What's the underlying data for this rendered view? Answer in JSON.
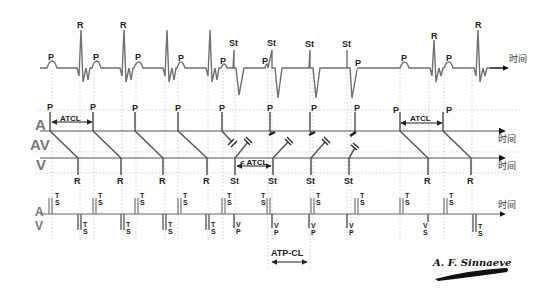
{
  "diagram": {
    "author_signature": "A. F. Sinnaeve",
    "time_axis_label": "时间",
    "row_labels": {
      "atrium": "A",
      "av": "AV",
      "ventricle": "V"
    },
    "marker_labels": {
      "atrium_row": "A",
      "ventricle_row": "V"
    },
    "colors": {
      "trace": "#6e6e6e",
      "line": "#555555",
      "grid": "#b0b0b0",
      "text": "#222222"
    },
    "ecg": {
      "labels": [
        {
          "text": "P",
          "x": 52,
          "y": 58
        },
        {
          "text": "R",
          "x": 81,
          "y": 28
        },
        {
          "text": "P",
          "x": 97,
          "y": 58
        },
        {
          "text": "R",
          "x": 126,
          "y": 28
        },
        {
          "text": "P",
          "x": 139,
          "y": 58
        },
        {
          "text": "P",
          "x": 182,
          "y": 62
        },
        {
          "text": "P",
          "x": 224,
          "y": 66
        },
        {
          "text": "St",
          "x": 234,
          "y": 46
        },
        {
          "text": "P",
          "x": 265,
          "y": 66
        },
        {
          "text": "St",
          "x": 272,
          "y": 46
        },
        {
          "text": "St",
          "x": 310,
          "y": 46
        },
        {
          "text": "St",
          "x": 347,
          "y": 46
        },
        {
          "text": "P",
          "x": 357,
          "y": 66
        },
        {
          "text": "P",
          "x": 404,
          "y": 62
        },
        {
          "text": "R",
          "x": 435,
          "y": 39
        },
        {
          "text": "P",
          "x": 449,
          "y": 62
        },
        {
          "text": "R",
          "x": 479,
          "y": 28
        }
      ]
    },
    "ladder": {
      "p_labels": [
        "P",
        "P",
        "P",
        "P",
        "P",
        "P",
        "P",
        "P",
        "P",
        "P"
      ],
      "v_labels": [
        "R",
        "R",
        "R",
        "R",
        "St",
        "St",
        "St",
        "St",
        "R",
        "R"
      ],
      "atcl_label_1": "ATCL",
      "atcl_label_2": "< ATCL",
      "atcl_label_3": "ATCL"
    },
    "markers": {
      "atrial_sense": "TS",
      "ventricular_sense": "TS",
      "ventricular_pace": "VP",
      "ventricular_sense_single": "VS",
      "atp_cl_label": "ATP-CL"
    }
  }
}
